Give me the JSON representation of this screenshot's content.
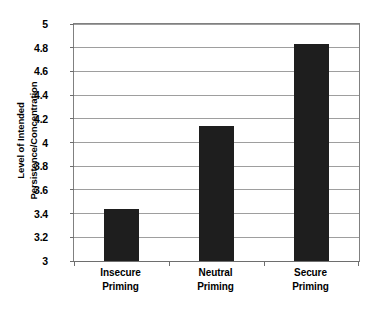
{
  "chart_data": {
    "type": "bar",
    "title": "",
    "subtitle": "",
    "xlabel": "",
    "ylabel_lines": [
      "Level of Intended",
      "Persistence/Concentration"
    ],
    "ylabel": "Level of Intended Persistence/Concentration",
    "categories": [
      "Insecure Priming",
      "Neutral Priming",
      "Secure Priming"
    ],
    "category_lines": [
      [
        "Insecure",
        "Priming"
      ],
      [
        "Neutral",
        "Priming"
      ],
      [
        "Secure",
        "Priming"
      ]
    ],
    "values": [
      3.44,
      4.14,
      4.83
    ],
    "ylim": [
      3,
      5
    ],
    "ytick_values": [
      3,
      3.2,
      3.4,
      3.6,
      3.8,
      4,
      4.2,
      4.4,
      4.6,
      4.8,
      5
    ],
    "ytick_labels": [
      "3",
      "3.2",
      "3.4",
      "3.6",
      "3.8",
      "4",
      "4.2",
      "4.4",
      "4.6",
      "4.8",
      "5"
    ],
    "grid": true,
    "grid_axis": "y",
    "legend": false,
    "legend_position": "none",
    "bar_color": "#1e1e1e",
    "gridline_color": "#9e9e9e",
    "axis_color": "#6e6e6e",
    "background_color": "#ffffff"
  }
}
